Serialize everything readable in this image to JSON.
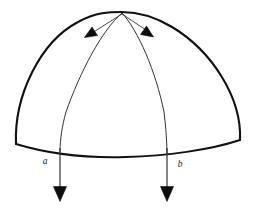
{
  "figure": {
    "background_color": "#ffffff",
    "stroke_color": "#111111",
    "thin_stroke_color": "#333333",
    "arrow_fill": "#0d0d0d",
    "width": 258,
    "height": 210
  },
  "labels": {
    "left_meridian": "a",
    "right_meridian": "b"
  },
  "geometry": {
    "apex": {
      "x": 122,
      "y": 13
    },
    "dome_left_base": {
      "x": 16,
      "y": 144
    },
    "dome_right_base": {
      "x": 240,
      "y": 140
    },
    "base_sag_point": {
      "x": 126,
      "y": 157
    },
    "left_meridian_base": {
      "x": 60,
      "y": 152
    },
    "right_meridian_base": {
      "x": 167,
      "y": 155
    },
    "left_arrow_tip": {
      "x": 60,
      "y": 201
    },
    "right_arrow_tip": {
      "x": 167,
      "y": 201
    },
    "apex_arrow_left_tip": {
      "x": 85,
      "y": 37
    },
    "apex_arrow_right_tip": {
      "x": 152,
      "y": 37
    }
  },
  "elements": {
    "dome_outline_name": "dome-outline",
    "base_curve_name": "dome-base-curve",
    "left_meridian_name": "meridian-a",
    "right_meridian_name": "meridian-b",
    "left_drop_arrow_name": "drop-arrow-a",
    "right_drop_arrow_name": "drop-arrow-b",
    "apex_left_arrow_name": "apex-arrow-left",
    "apex_right_arrow_name": "apex-arrow-right"
  }
}
